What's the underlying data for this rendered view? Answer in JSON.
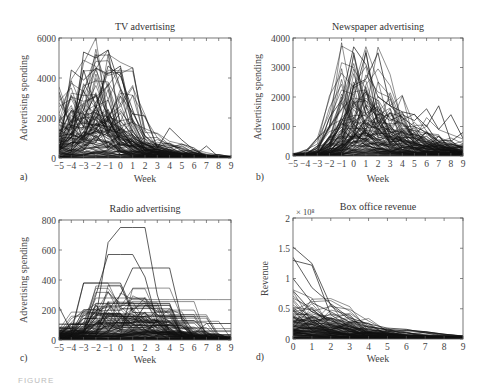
{
  "figure": {
    "caption_fragment": "FIGURE"
  },
  "chart_data": [
    {
      "id": "a",
      "type": "line",
      "panel_label": "a)",
      "title": "TV advertising",
      "xlabel": "Week",
      "ylabel": "Advertising spending",
      "xlim": [
        -5,
        9
      ],
      "ylim": [
        0,
        6000
      ],
      "xticks": [
        -5,
        -4,
        -3,
        -2,
        -1,
        0,
        1,
        2,
        3,
        4,
        5,
        6,
        7,
        8,
        9
      ],
      "yticks": [
        0,
        2000,
        4000,
        6000
      ],
      "xtick_labels": [
        "−5",
        "−4",
        "−3",
        "−2",
        "−1",
        "0",
        "1",
        "2",
        "3",
        "4",
        "5",
        "6",
        "7",
        "8",
        "9"
      ],
      "ytick_labels": [
        "0",
        "2000",
        "4000",
        "6000"
      ],
      "grid": false,
      "series_count_estimate": 120,
      "notable_series": [
        {
          "name": "peak-1",
          "x": [
            -5,
            -4,
            -3,
            -2,
            -1,
            0,
            1,
            2,
            3,
            4,
            5,
            6,
            7,
            8,
            9
          ],
          "values": [
            0,
            300,
            5300,
            5000,
            5400,
            3500,
            2200,
            2100,
            500,
            1500,
            900,
            400,
            100,
            0,
            0
          ]
        },
        {
          "name": "peak-2",
          "x": [
            -5,
            -4,
            -3,
            -2,
            -1,
            0,
            1,
            2,
            3,
            4,
            5,
            6,
            7,
            8,
            9
          ],
          "values": [
            3300,
            1500,
            4400,
            2500,
            4600,
            4100,
            2400,
            800,
            600,
            400,
            200,
            100,
            600,
            50,
            100
          ]
        },
        {
          "name": "peak-3",
          "x": [
            -5,
            -4,
            -3,
            -2,
            -1,
            0,
            1,
            2,
            3,
            4,
            5,
            6,
            7,
            8,
            9
          ],
          "values": [
            200,
            4400,
            3900,
            4500,
            4200,
            4600,
            1800,
            700,
            700,
            500,
            700,
            500,
            0,
            0,
            0
          ]
        }
      ],
      "envelope": {
        "x": [
          -5,
          -4,
          -3,
          -2,
          -1,
          0,
          1,
          2,
          3,
          4,
          5,
          6,
          7,
          8,
          9
        ],
        "typical_peak": [
          1000,
          2500,
          3000,
          2800,
          3200,
          2800,
          1200,
          700,
          500,
          400,
          250,
          150,
          100,
          50,
          30
        ]
      }
    },
    {
      "id": "b",
      "type": "line",
      "panel_label": "b)",
      "title": "Newspaper advertising",
      "xlabel": "Week",
      "ylabel": "Advertising spending",
      "xlim": [
        -5,
        9
      ],
      "ylim": [
        0,
        4000
      ],
      "xticks": [
        -5,
        -4,
        -3,
        -2,
        -1,
        0,
        1,
        2,
        3,
        4,
        5,
        6,
        7,
        8,
        9
      ],
      "yticks": [
        0,
        1000,
        2000,
        3000,
        4000
      ],
      "xtick_labels": [
        "−5",
        "−4",
        "−3",
        "−2",
        "−1",
        "0",
        "1",
        "2",
        "3",
        "4",
        "5",
        "6",
        "7",
        "8",
        "9"
      ],
      "ytick_labels": [
        "0",
        "1000",
        "2000",
        "3000",
        "4000"
      ],
      "grid": false,
      "series_count_estimate": 120,
      "notable_series": [
        {
          "name": "peak-1",
          "x": [
            -5,
            -4,
            -3,
            -2,
            -1,
            0,
            1,
            2,
            3,
            4,
            5,
            6,
            7,
            8,
            9
          ],
          "values": [
            0,
            200,
            100,
            1300,
            1900,
            3700,
            3100,
            2000,
            1700,
            1300,
            1000,
            800,
            500,
            400,
            300
          ]
        },
        {
          "name": "peak-2",
          "x": [
            -5,
            -4,
            -3,
            -2,
            -1,
            0,
            1,
            2,
            3,
            4,
            5,
            6,
            7,
            8,
            9
          ],
          "values": [
            0,
            0,
            200,
            1000,
            1600,
            2000,
            3500,
            1500,
            1200,
            1400,
            1200,
            1600,
            900,
            1400,
            600
          ]
        },
        {
          "name": "peak-3",
          "x": [
            -5,
            -4,
            -3,
            -2,
            -1,
            0,
            1,
            2,
            3,
            4,
            5,
            6,
            7,
            8,
            9
          ],
          "values": [
            0,
            0,
            0,
            300,
            800,
            2400,
            2600,
            3500,
            1700,
            1500,
            1400,
            1000,
            1700,
            500,
            800
          ]
        }
      ],
      "envelope": {
        "x": [
          -5,
          -4,
          -3,
          -2,
          -1,
          0,
          1,
          2,
          3,
          4,
          5,
          6,
          7,
          8,
          9
        ],
        "typical_peak": [
          30,
          60,
          100,
          400,
          1200,
          2200,
          2000,
          1600,
          1200,
          900,
          700,
          500,
          400,
          300,
          200
        ]
      }
    },
    {
      "id": "c",
      "type": "line",
      "panel_label": "c)",
      "title": "Radio advertising",
      "xlabel": "Week",
      "ylabel": "Advertising spending",
      "xlim": [
        -5,
        9
      ],
      "ylim": [
        0,
        800
      ],
      "xticks": [
        -5,
        -4,
        -3,
        -2,
        -1,
        0,
        1,
        2,
        3,
        4,
        5,
        6,
        7,
        8,
        9
      ],
      "yticks": [
        0,
        200,
        400,
        600,
        800
      ],
      "xtick_labels": [
        "−5",
        "−4",
        "−3",
        "−2",
        "−1",
        "0",
        "1",
        "2",
        "3",
        "4",
        "5",
        "6",
        "7",
        "8",
        "9"
      ],
      "ytick_labels": [
        "0",
        "200",
        "400",
        "600",
        "800"
      ],
      "grid": false,
      "series_count_estimate": 120,
      "notable_series": [
        {
          "name": "plateau-1",
          "x": [
            -5,
            -4,
            -3,
            -2,
            -1,
            0,
            1,
            2,
            3,
            4,
            5,
            6,
            7,
            8,
            9
          ],
          "values": [
            0,
            20,
            50,
            150,
            650,
            750,
            750,
            750,
            300,
            50,
            20,
            0,
            0,
            0,
            0
          ]
        },
        {
          "name": "plateau-2",
          "x": [
            -5,
            -4,
            -3,
            -2,
            -1,
            0,
            1,
            2,
            3,
            4,
            5,
            6,
            7,
            8,
            9
          ],
          "values": [
            0,
            30,
            60,
            300,
            570,
            570,
            570,
            420,
            120,
            30,
            0,
            0,
            0,
            0,
            0
          ]
        },
        {
          "name": "plateau-3",
          "x": [
            -5,
            -4,
            -3,
            -2,
            -1,
            0,
            1,
            2,
            3,
            4,
            5,
            6,
            7,
            8,
            9
          ],
          "values": [
            0,
            0,
            30,
            80,
            200,
            300,
            480,
            480,
            480,
            480,
            130,
            130,
            50,
            0,
            0
          ]
        },
        {
          "name": "plateau-4",
          "x": [
            -5,
            -4,
            -3,
            -2,
            -1,
            0,
            1,
            2,
            3,
            4,
            5,
            6,
            7,
            8,
            9
          ],
          "values": [
            220,
            60,
            380,
            380,
            380,
            380,
            200,
            100,
            50,
            0,
            0,
            0,
            0,
            0,
            0
          ]
        },
        {
          "name": "late-1",
          "x": [
            -5,
            -4,
            -3,
            -2,
            -1,
            0,
            1,
            2,
            3,
            4,
            5,
            6,
            7,
            8,
            9
          ],
          "values": [
            0,
            0,
            0,
            0,
            0,
            0,
            0,
            0,
            30,
            40,
            40,
            40,
            110,
            110,
            110
          ]
        }
      ],
      "envelope": {
        "x": [
          -5,
          -4,
          -3,
          -2,
          -1,
          0,
          1,
          2,
          3,
          4,
          5,
          6,
          7,
          8,
          9
        ],
        "typical_peak": [
          50,
          60,
          150,
          200,
          200,
          200,
          200,
          180,
          150,
          100,
          50,
          30,
          20,
          10,
          10
        ]
      }
    },
    {
      "id": "d",
      "type": "line",
      "panel_label": "d)",
      "title": "Box office revenue",
      "xlabel": "Week",
      "ylabel": "Revenue",
      "y_scale_label": "× 10⁸",
      "xlim": [
        0,
        9
      ],
      "ylim": [
        0,
        2
      ],
      "xticks": [
        0,
        1,
        2,
        3,
        4,
        5,
        6,
        7,
        8,
        9
      ],
      "yticks": [
        0,
        0.5,
        1,
        1.5,
        2
      ],
      "xtick_labels": [
        "0",
        "1",
        "2",
        "3",
        "4",
        "5",
        "6",
        "7",
        "8",
        "9"
      ],
      "ytick_labels": [
        "0",
        "0.5",
        "1",
        "1.5",
        "2"
      ],
      "grid": false,
      "series_count_estimate": 120,
      "notable_series": [
        {
          "name": "top-1",
          "x": [
            0,
            1,
            2,
            3,
            4,
            5,
            6,
            7,
            8,
            9
          ],
          "values": [
            1.52,
            1.25,
            0.55,
            0.32,
            0.2,
            0.16,
            0.14,
            0.12,
            0.08,
            0.05
          ]
        },
        {
          "name": "top-2",
          "x": [
            0,
            1,
            2,
            3,
            4,
            5,
            6,
            7,
            8,
            9
          ],
          "values": [
            1.35,
            0.85,
            0.58,
            0.35,
            0.25,
            0.18,
            0.16,
            0.1,
            0.06,
            0.04
          ]
        },
        {
          "name": "top-3",
          "x": [
            0,
            1,
            2,
            3,
            4,
            5,
            6,
            7,
            8,
            9
          ],
          "values": [
            1.3,
            1.22,
            0.4,
            0.2,
            0.12,
            0.08,
            0.06,
            0.04,
            0.03,
            0.02
          ]
        },
        {
          "name": "mid-1",
          "x": [
            0,
            1,
            2,
            3,
            4,
            5,
            6,
            7,
            8,
            9
          ],
          "values": [
            1.0,
            0.6,
            0.45,
            0.28,
            0.2,
            0.15,
            0.1,
            0.07,
            0.05,
            0.04
          ]
        },
        {
          "name": "mid-2",
          "x": [
            0,
            1,
            2,
            3,
            4,
            5,
            6,
            7,
            8,
            9
          ],
          "values": [
            0.8,
            0.45,
            0.3,
            0.2,
            0.15,
            0.12,
            0.15,
            0.12,
            0.08,
            0.05
          ]
        }
      ],
      "envelope": {
        "x": [
          0,
          1,
          2,
          3,
          4,
          5,
          6,
          7,
          8,
          9
        ],
        "typical_peak": [
          0.45,
          0.4,
          0.3,
          0.2,
          0.12,
          0.08,
          0.06,
          0.04,
          0.03,
          0.02
        ]
      }
    }
  ]
}
